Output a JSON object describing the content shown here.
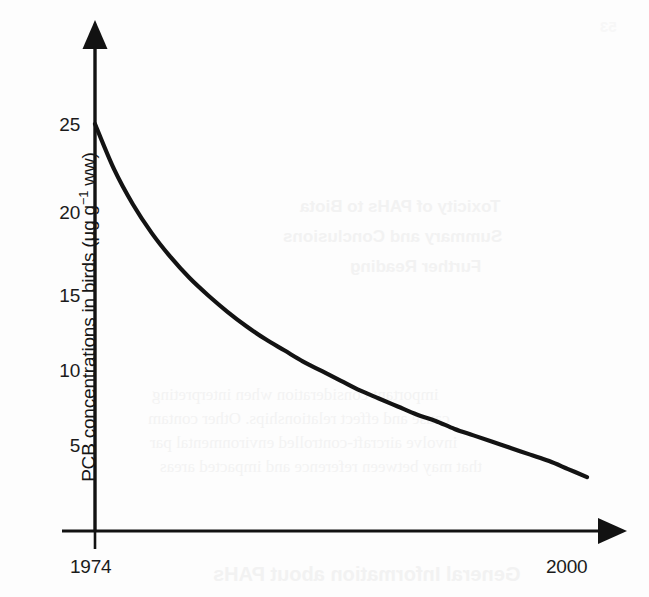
{
  "figure": {
    "background_color": "#fdfdfd",
    "ink_color": "#111111"
  },
  "chart_data": {
    "type": "line",
    "title": "",
    "xlabel": "",
    "ylabel": "PCB concentrations in birds (µg g⁻¹ ww)",
    "ylabel_parts": {
      "prefix": "PCB concentrations in birds (µg g",
      "exponent": "−1",
      "suffix": " ww)"
    },
    "x_tick_labels": [
      "1974",
      "2000"
    ],
    "y_tick_labels": [
      "5",
      "10",
      "15",
      "20",
      "25"
    ],
    "y_ticks": [
      5,
      10,
      15,
      20,
      25
    ],
    "ylim": [
      0,
      28
    ],
    "xlim": [
      "1974",
      "2002"
    ],
    "grid": false,
    "legend": null,
    "axis_arrows": {
      "y_axis": "up",
      "x_axis": "right"
    },
    "series": [
      {
        "name": "PCB concentration in birds",
        "x": [
          1974,
          1975,
          1976,
          1977,
          1978,
          1979,
          1980,
          1981,
          1982,
          1983,
          1984,
          1985,
          1986,
          1987,
          1988,
          1989,
          1990,
          1991,
          1992,
          1993,
          1994,
          1995,
          1996,
          1997,
          1998,
          1999,
          2000
        ],
        "values": [
          25.0,
          22.2,
          20.0,
          18.2,
          16.7,
          15.4,
          14.3,
          13.3,
          12.4,
          11.6,
          10.9,
          10.2,
          9.6,
          9.0,
          8.4,
          7.9,
          7.4,
          6.9,
          6.5,
          6.0,
          5.6,
          5.2,
          4.8,
          4.4,
          4.0,
          3.5,
          3.0
        ]
      }
    ]
  },
  "bleedthrough": {
    "description": "faint mirrored show-through text from the reverse side of the scanned page",
    "page_number": "53",
    "headings": [
      "Toxicity of PAHs to Biota",
      "Summary and Conclusions",
      "Further Reading"
    ],
    "body_lines": [
      "important consideration when interpreting",
      "cause and effect relationships. Other contam",
      "involve aircraft-controlled environmental par",
      "that may between reference and impacted areas"
    ],
    "bottom_heading": "General Information about PAHs"
  }
}
